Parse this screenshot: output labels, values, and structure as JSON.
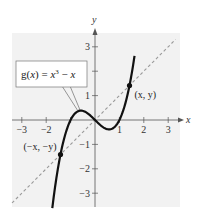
{
  "chart_data": {
    "type": "line",
    "title": "",
    "xlabel": "x",
    "ylabel": "y",
    "xlim": [
      -3.5,
      3.5
    ],
    "ylim": [
      -3.5,
      3.5
    ],
    "grid": false,
    "x_ticks": [
      -3,
      -2,
      1,
      2,
      3
    ],
    "x_tick_labels": [
      "−3",
      "−2",
      "1",
      "2",
      "3"
    ],
    "y_ticks": [
      3,
      1,
      -1,
      -2,
      -3
    ],
    "y_tick_labels": [
      "3",
      "1",
      "−1",
      "−2",
      "−3"
    ],
    "minor_ticks": {
      "x": [
        -1
      ],
      "y": [
        2
      ]
    },
    "series": [
      {
        "name": "g(x) = x^3 - x",
        "style": "solid-thick",
        "color": "#111111",
        "function": "x^3 - x",
        "x_range": [
          -1.75,
          1.62
        ]
      },
      {
        "name": "y = x",
        "style": "dashed",
        "color": "#999999",
        "function": "x",
        "x_range": [
          -3.4,
          3.3
        ]
      }
    ],
    "points": [
      {
        "x": 1.414,
        "y": 1.414,
        "label": "(x, y)"
      },
      {
        "x": -1.414,
        "y": -1.414,
        "label": "(−x, −y)"
      }
    ],
    "annotations": [
      {
        "text": "g(x) = x³ − x",
        "points_to": [
          -0.6,
          0.38
        ]
      }
    ],
    "function_label": {
      "g": "g",
      "open": "(",
      "x": "x",
      "close": ")",
      "eq": " = ",
      "x2": "x",
      "exp": "3",
      "minus": " − ",
      "x3": "x"
    },
    "background_color": "#f2f2f2"
  }
}
